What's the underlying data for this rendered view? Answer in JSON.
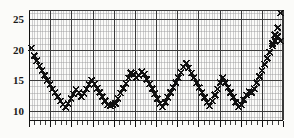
{
  "figure": {
    "title": "",
    "background_color": "#fbfbf9",
    "ink_color": "#111111",
    "grid_major_color": "#3a3a3a",
    "grid_minor_color": "#9a9a9a",
    "marker": "x-cross"
  },
  "axes": {
    "y_label": "",
    "x_label": "",
    "y_ticks": [
      10,
      15,
      20,
      25
    ],
    "y_tick_labels": [
      "10",
      "15",
      "20",
      "25"
    ],
    "x_ticks_visible": true,
    "x_tick_labels": [],
    "grid": "on"
  },
  "chart_data": {
    "type": "scatter",
    "title": "",
    "xlabel": "",
    "ylabel": "",
    "xlim": [
      0,
      97
    ],
    "ylim": [
      8.5,
      26.5
    ],
    "ytick_values": [
      10,
      15,
      20,
      25
    ],
    "ytick_labels": [
      "10",
      "15",
      "20",
      "25"
    ],
    "xtick_labels": [],
    "grid": true,
    "legend": null,
    "marker_style": "x",
    "series": [
      {
        "name": "series-1",
        "x": [
          1,
          2,
          3,
          4,
          5,
          6,
          7,
          8,
          9,
          10,
          11,
          12,
          13,
          14,
          15,
          16,
          17,
          18,
          19,
          20,
          21,
          22,
          23,
          24,
          25,
          26,
          27,
          28,
          29,
          30,
          31,
          32,
          33,
          34,
          35,
          36,
          37,
          38,
          39,
          40,
          41,
          42,
          43,
          44,
          45,
          46,
          47,
          48,
          49,
          50,
          51,
          52,
          53,
          54,
          55,
          56,
          57,
          58,
          59,
          60,
          61,
          62,
          63,
          64,
          65,
          66,
          67,
          68,
          69,
          70,
          71,
          72,
          73,
          74,
          75,
          76,
          77,
          78,
          79,
          80,
          81,
          82,
          83,
          84,
          85,
          86,
          87,
          88,
          89,
          90,
          91,
          92,
          93,
          94,
          95,
          96
        ],
        "y": [
          20.3,
          19.0,
          18.2,
          17.3,
          16.6,
          15.8,
          15.0,
          14.3,
          13.6,
          13.0,
          12.3,
          11.6,
          11.0,
          10.6,
          11.2,
          12.0,
          12.8,
          13.5,
          13.0,
          12.3,
          12.8,
          13.6,
          14.3,
          15.0,
          14.4,
          13.7,
          13.0,
          12.3,
          11.6,
          11.0,
          10.8,
          11.0,
          11.2,
          12.0,
          12.9,
          13.7,
          14.5,
          15.4,
          16.2,
          16.0,
          15.4,
          15.8,
          16.4,
          16.0,
          15.2,
          14.4,
          13.6,
          12.8,
          12.0,
          11.2,
          10.6,
          11.4,
          12.2,
          13.0,
          13.8,
          14.6,
          15.4,
          16.3,
          17.2,
          17.8,
          17.0,
          16.2,
          15.4,
          14.6,
          13.8,
          13.0,
          12.2,
          11.4,
          10.8,
          11.6,
          12.6,
          13.6,
          14.6,
          15.4,
          14.6,
          13.8,
          13.0,
          12.2,
          11.4,
          10.6,
          11.0,
          11.8,
          12.6,
          13.2,
          13.0,
          13.6,
          14.6,
          15.6,
          16.6,
          17.6,
          18.6,
          19.6,
          20.6,
          21.4,
          22.2,
          21.4
        ]
      }
    ],
    "extra_points": {
      "x": [
        93,
        94,
        95,
        96
      ],
      "y": [
        21.0,
        22.4,
        23.6,
        26.0
      ]
    }
  }
}
